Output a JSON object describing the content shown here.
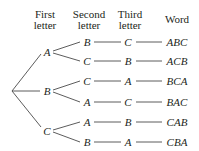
{
  "headers": {
    "first": [
      "First",
      "letter"
    ],
    "second": [
      "Second",
      "letter"
    ],
    "third": [
      "Third",
      "letter"
    ],
    "word": "Word"
  },
  "tree": {
    "first_letters": [
      "A",
      "B",
      "C"
    ],
    "rows": [
      {
        "second": "B",
        "third": "C",
        "word": "ABC"
      },
      {
        "second": "C",
        "third": "B",
        "word": "ACB"
      },
      {
        "second": "C",
        "third": "A",
        "word": "BCA"
      },
      {
        "second": "A",
        "third": "C",
        "word": "BAC"
      },
      {
        "second": "A",
        "third": "B",
        "word": "CAB"
      },
      {
        "second": "B",
        "third": "A",
        "word": "CBA"
      }
    ]
  }
}
